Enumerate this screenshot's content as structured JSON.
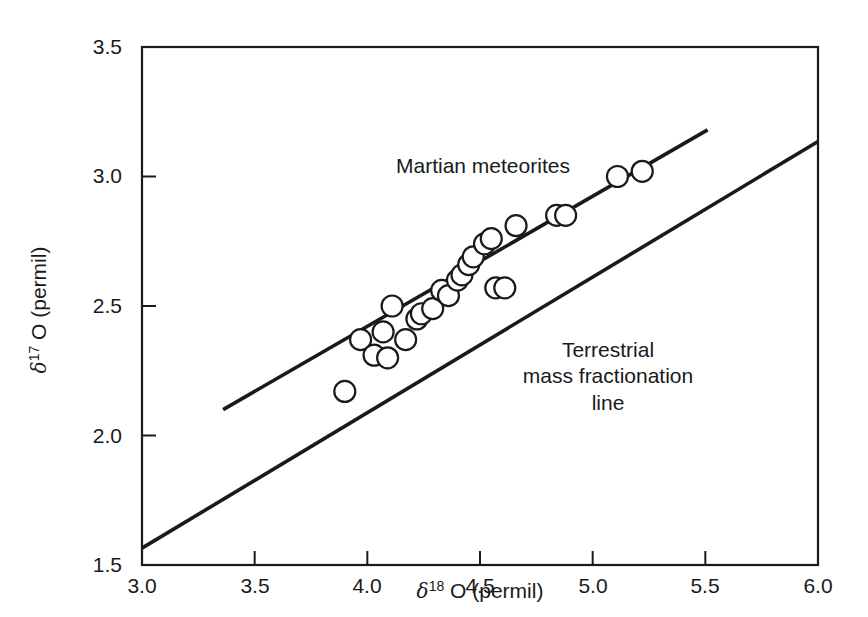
{
  "chart_data": {
    "type": "scatter",
    "title": "",
    "xlabel": "δ18 O (permil)",
    "ylabel": "δ17 O (permil)",
    "xlim": [
      3.0,
      6.0
    ],
    "ylim": [
      1.5,
      3.5
    ],
    "grid": false,
    "legend_position": "none",
    "x_ticks": [
      "3.0",
      "3.5",
      "4.0",
      "4.5",
      "5.0",
      "5.5",
      "6.0"
    ],
    "x_tick_values": [
      3.0,
      3.5,
      4.0,
      4.5,
      5.0,
      5.5,
      6.0
    ],
    "y_ticks": [
      "3.5",
      "3.0",
      "2.5",
      "2.0",
      "1.5"
    ],
    "y_tick_values": [
      3.5,
      3.0,
      2.5,
      2.0,
      1.5
    ],
    "series": [
      {
        "name": "Martian meteorites",
        "type": "scatter",
        "marker": "open-circle",
        "points": [
          [
            3.9,
            2.17
          ],
          [
            3.97,
            2.37
          ],
          [
            4.03,
            2.31
          ],
          [
            4.09,
            2.3
          ],
          [
            4.07,
            2.4
          ],
          [
            4.11,
            2.5
          ],
          [
            4.17,
            2.37
          ],
          [
            4.22,
            2.45
          ],
          [
            4.24,
            2.47
          ],
          [
            4.29,
            2.49
          ],
          [
            4.33,
            2.56
          ],
          [
            4.36,
            2.54
          ],
          [
            4.4,
            2.6
          ],
          [
            4.42,
            2.62
          ],
          [
            4.45,
            2.66
          ],
          [
            4.47,
            2.69
          ],
          [
            4.52,
            2.74
          ],
          [
            4.55,
            2.76
          ],
          [
            4.57,
            2.57
          ],
          [
            4.61,
            2.57
          ],
          [
            4.66,
            2.81
          ],
          [
            4.84,
            2.85
          ],
          [
            4.88,
            2.85
          ],
          [
            5.11,
            3.0
          ],
          [
            5.22,
            3.02
          ]
        ]
      },
      {
        "name": "Martian fractionation line",
        "type": "line",
        "x_start": 3.36,
        "y_start": 2.1,
        "x_end": 5.51,
        "y_end": 3.18
      },
      {
        "name": "Terrestrial mass fractionation line",
        "type": "line",
        "x_start": 3.0,
        "y_start": 1.565,
        "x_end": 6.0,
        "y_end": 3.135
      }
    ],
    "annotations": [
      {
        "name": "martian-meteorites-label",
        "text": "Martian meteorites",
        "x": 4.4,
        "y": 3.06
      },
      {
        "name": "terrestrial-line-label",
        "lines": [
          "Terrestrial",
          "mass fractionation",
          "line"
        ],
        "x": 5.07,
        "y": 2.35
      }
    ]
  },
  "axes": {
    "x": {
      "label_prefix": "δ",
      "label_sup": "18",
      "label_suffix": " O (permil)",
      "ticks": [
        "3.0",
        "3.5",
        "4.0",
        "4.5",
        "5.0",
        "5.5",
        "6.0"
      ]
    },
    "y": {
      "label_prefix": "δ",
      "label_sup": "17",
      "label_suffix": " O (permil)",
      "ticks": [
        "3.5",
        "3.0",
        "2.5",
        "2.0",
        "1.5"
      ]
    }
  },
  "annotations": {
    "martian": "Martian meteorites",
    "terrestrial_line1": "Terrestrial",
    "terrestrial_line2": "mass fractionation",
    "terrestrial_line3": "line"
  },
  "colors": {
    "ink": "#1a1a1a",
    "background": "#ffffff",
    "marker_stroke": "#1a1a1a"
  }
}
